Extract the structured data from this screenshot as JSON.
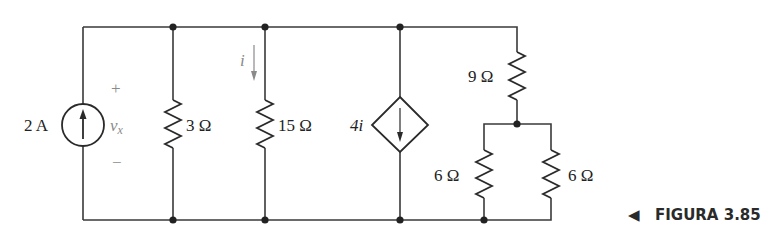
{
  "figure": {
    "caption": "FIGURA 3.85",
    "caption_marker": "◀"
  },
  "components": {
    "current_source": {
      "label": "2 A",
      "type": "independent-current-source",
      "direction": "up"
    },
    "voltage_label": {
      "name": "v",
      "subscript": "x",
      "plus": "+",
      "minus": "−"
    },
    "r1": {
      "label": "3 Ω",
      "value_ohms": 3
    },
    "r2": {
      "label": "15 Ω",
      "value_ohms": 15
    },
    "current_i": {
      "label": "i",
      "direction": "down"
    },
    "dependent_source": {
      "label": "4i",
      "type": "dependent-current-source",
      "direction": "down"
    },
    "r3": {
      "label": "9 Ω",
      "value_ohms": 9
    },
    "r4": {
      "label": "6 Ω",
      "value_ohms": 6
    },
    "r5": {
      "label": "6 Ω",
      "value_ohms": 6
    }
  },
  "colors": {
    "wire": "#3a3a3a",
    "annotation_gray": "#8a8a8a"
  }
}
